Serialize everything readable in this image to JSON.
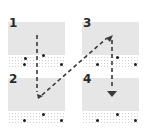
{
  "diagram": {
    "type": "reading-order",
    "panels": [
      {
        "label": "1",
        "x": 8,
        "y": 22
      },
      {
        "label": "3",
        "x": 82,
        "y": 22
      },
      {
        "label": "2",
        "x": 8,
        "y": 78
      },
      {
        "label": "4",
        "x": 82,
        "y": 78
      }
    ],
    "flow_order": [
      "1",
      "2",
      "3",
      "4"
    ],
    "colors": {
      "panel_fill": "#e6e6e6",
      "arrow": "#3a3a3a",
      "text": "#2a2a2a"
    }
  }
}
